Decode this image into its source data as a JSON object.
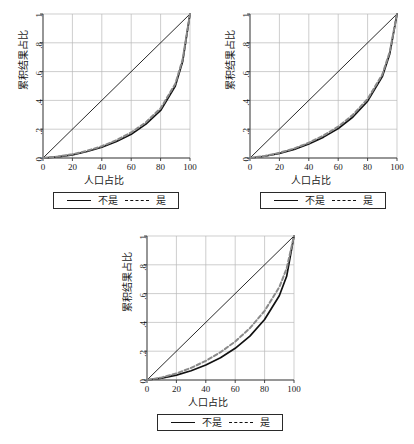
{
  "figure": {
    "panel_count": 3,
    "background": "#ffffff"
  },
  "axis": {
    "xlabel": "人口占比",
    "ylabel": "累积结果占比",
    "xticks": [
      "0",
      "20",
      "40",
      "60",
      "80",
      "100"
    ],
    "yticks": [
      "0",
      ".2",
      ".4",
      ".6",
      ".8",
      "1"
    ]
  },
  "legend": {
    "solid_label": "不是",
    "dashed_label": "是"
  },
  "chart_data": [
    {
      "type": "line",
      "title": "",
      "xlabel": "人口占比",
      "ylabel": "累积结果占比",
      "xlim": [
        0,
        100
      ],
      "ylim": [
        0,
        1
      ],
      "xticks": [
        0,
        20,
        40,
        60,
        80,
        100
      ],
      "yticks": [
        0,
        0.2,
        0.4,
        0.6,
        0.8,
        1
      ],
      "grid": true,
      "legend_position": "below-axes",
      "series": [
        {
          "name": "equality-line",
          "style": "solid-thin",
          "color": "#111111",
          "x": [
            0,
            100
          ],
          "values": [
            0,
            1
          ]
        },
        {
          "name": "不是",
          "style": "solid",
          "color": "#111111",
          "x": [
            0,
            10,
            20,
            30,
            40,
            50,
            60,
            70,
            80,
            90,
            95,
            100
          ],
          "values": [
            0,
            0.008,
            0.022,
            0.045,
            0.075,
            0.115,
            0.165,
            0.235,
            0.33,
            0.5,
            0.67,
            1.0
          ]
        },
        {
          "name": "是",
          "style": "dashed",
          "color": "#8a8a8a",
          "x": [
            0,
            10,
            20,
            30,
            40,
            50,
            60,
            70,
            80,
            90,
            95,
            100
          ],
          "values": [
            0,
            0.01,
            0.026,
            0.05,
            0.082,
            0.124,
            0.177,
            0.248,
            0.345,
            0.515,
            0.685,
            1.0
          ]
        }
      ]
    },
    {
      "type": "line",
      "title": "",
      "xlabel": "人口占比",
      "ylabel": "累积结果占比",
      "xlim": [
        0,
        100
      ],
      "ylim": [
        0,
        1
      ],
      "xticks": [
        0,
        20,
        40,
        60,
        80,
        100
      ],
      "yticks": [
        0,
        0.2,
        0.4,
        0.6,
        0.8,
        1
      ],
      "grid": true,
      "legend_position": "below-axes",
      "series": [
        {
          "name": "equality-line",
          "style": "solid-thin",
          "color": "#111111",
          "x": [
            0,
            100
          ],
          "values": [
            0,
            1
          ]
        },
        {
          "name": "不是",
          "style": "solid",
          "color": "#111111",
          "x": [
            0,
            10,
            20,
            30,
            40,
            50,
            60,
            70,
            80,
            90,
            95,
            100
          ],
          "values": [
            0,
            0.012,
            0.032,
            0.06,
            0.097,
            0.145,
            0.205,
            0.285,
            0.395,
            0.565,
            0.72,
            1.0
          ]
        },
        {
          "name": "是",
          "style": "dashed",
          "color": "#8a8a8a",
          "x": [
            0,
            10,
            20,
            30,
            40,
            50,
            60,
            70,
            80,
            90,
            95,
            100
          ],
          "values": [
            0,
            0.014,
            0.036,
            0.066,
            0.106,
            0.156,
            0.218,
            0.3,
            0.41,
            0.58,
            0.735,
            1.0
          ]
        }
      ]
    },
    {
      "type": "line",
      "title": "",
      "xlabel": "人口占比",
      "ylabel": "累积结果占比",
      "xlim": [
        0,
        100
      ],
      "ylim": [
        0,
        1
      ],
      "xticks": [
        0,
        20,
        40,
        60,
        80,
        100
      ],
      "yticks": [
        0,
        0.2,
        0.4,
        0.6,
        0.8,
        1
      ],
      "grid": true,
      "legend_position": "below-axes",
      "series": [
        {
          "name": "equality-line",
          "style": "solid-thin",
          "color": "#111111",
          "x": [
            0,
            100
          ],
          "values": [
            0,
            1
          ]
        },
        {
          "name": "不是",
          "style": "solid",
          "color": "#111111",
          "x": [
            0,
            10,
            20,
            30,
            40,
            50,
            60,
            70,
            80,
            90,
            95,
            100
          ],
          "values": [
            0,
            0.013,
            0.034,
            0.064,
            0.104,
            0.155,
            0.22,
            0.305,
            0.42,
            0.585,
            0.72,
            1.0
          ]
        },
        {
          "name": "是",
          "style": "dashed",
          "color": "#8a8a8a",
          "x": [
            0,
            10,
            20,
            30,
            40,
            50,
            60,
            70,
            80,
            90,
            95,
            100
          ],
          "values": [
            0,
            0.018,
            0.046,
            0.084,
            0.133,
            0.193,
            0.267,
            0.36,
            0.48,
            0.645,
            0.775,
            1.0
          ]
        }
      ]
    }
  ]
}
